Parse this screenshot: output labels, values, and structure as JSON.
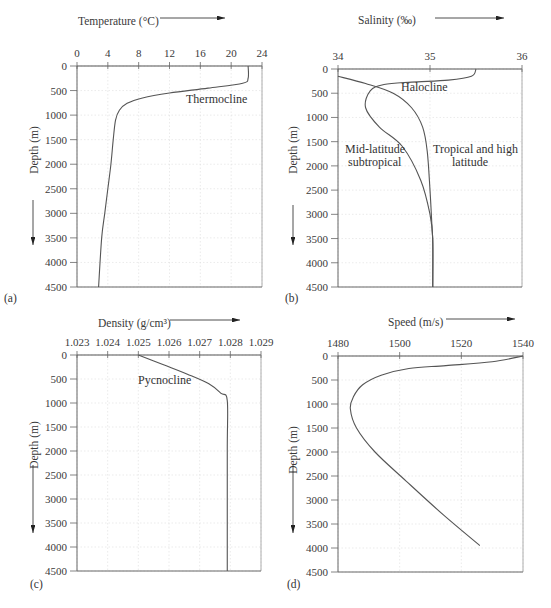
{
  "chart_data": [
    {
      "panel": "(a)",
      "type": "line",
      "title": "",
      "xlabel": "Temperature (°C)",
      "ylabel": "Depth (m)",
      "xlim": [
        0,
        24
      ],
      "ylim": [
        4500,
        0
      ],
      "xticks": [
        "0",
        "4",
        "8",
        "12",
        "16",
        "20",
        "24"
      ],
      "yticks": [
        "0",
        "500",
        "1000",
        "1500",
        "2000",
        "2500",
        "3000",
        "3500",
        "4000",
        "4500"
      ],
      "grid": true,
      "annotations": [
        {
          "text": "Thermocline",
          "x": 17.5,
          "y": 700
        }
      ],
      "series": [
        {
          "name": "Temperature",
          "x": [
            22.2,
            22.2,
            21.5,
            17,
            12,
            8.5,
            6.5,
            5.5,
            5.0,
            4.7,
            4.4,
            4.0,
            3.6,
            3.2,
            2.8
          ],
          "y": [
            0,
            250,
            350,
            450,
            550,
            650,
            760,
            900,
            1100,
            1500,
            2000,
            2500,
            3000,
            3500,
            4500
          ]
        }
      ]
    },
    {
      "panel": "(b)",
      "type": "line",
      "title": "",
      "xlabel": "Salinity (‰)",
      "ylabel": "Depth (m)",
      "xlim": [
        34,
        36
      ],
      "ylim": [
        4500,
        0
      ],
      "xticks": [
        "34",
        "35",
        "36"
      ],
      "yticks": [
        "0",
        "500",
        "1000",
        "1500",
        "2000",
        "2500",
        "3000",
        "3500",
        "4000",
        "4500"
      ],
      "grid": true,
      "annotations": [
        {
          "text": "Halocline",
          "x": 35.0,
          "y": 400
        },
        {
          "text": "Mid-latitude subtropical",
          "x": 34.35,
          "y": 1750
        },
        {
          "text": "Tropical and high latitude",
          "x": 35.45,
          "y": 1750
        }
      ],
      "series": [
        {
          "name": "Tropical and high latitude",
          "x": [
            34.0,
            34.3,
            34.6,
            34.8,
            34.92,
            34.97,
            35.0,
            35.02,
            35.03,
            35.03
          ],
          "y": [
            150,
            300,
            500,
            800,
            1200,
            1700,
            2500,
            3200,
            3600,
            4500
          ]
        },
        {
          "name": "Mid-latitude subtropical",
          "x": [
            35.5,
            35.45,
            35.2,
            34.8,
            34.5,
            34.35,
            34.3,
            34.45,
            34.7,
            34.9,
            35.0,
            35.03,
            35.03
          ],
          "y": [
            0,
            150,
            230,
            270,
            320,
            450,
            800,
            1200,
            1600,
            2300,
            3000,
            3500,
            4500
          ]
        }
      ]
    },
    {
      "panel": "(c)",
      "type": "line",
      "title": "",
      "xlabel": "Density (g/cm³)",
      "ylabel": "Depth (m)",
      "xlim": [
        1.023,
        1.029
      ],
      "ylim": [
        4500,
        0
      ],
      "xticks": [
        "1.023",
        "1.024",
        "1.025",
        "1.026",
        "1.027",
        "1.028",
        "1.029"
      ],
      "yticks": [
        "0",
        "500",
        "1000",
        "1500",
        "2000",
        "2500",
        "3000",
        "3500",
        "4000",
        "4500"
      ],
      "grid": true,
      "annotations": [
        {
          "text": "Pycnocline",
          "x": 1.0265,
          "y": 500
        }
      ],
      "series": [
        {
          "name": "Density",
          "x": [
            1.025,
            1.0258,
            1.0266,
            1.0273,
            1.0277,
            1.0279,
            1.0279,
            1.0279
          ],
          "y": [
            0,
            200,
            400,
            600,
            800,
            950,
            2000,
            4500
          ]
        }
      ]
    },
    {
      "panel": "(d)",
      "type": "line",
      "title": "",
      "xlabel": "Speed (m/s)",
      "ylabel": "Depth (m)",
      "xlim": [
        1480,
        1540
      ],
      "ylim": [
        4500,
        0
      ],
      "xticks": [
        "1480",
        "1500",
        "1520",
        "1540"
      ],
      "yticks": [
        "0",
        "500",
        "1000",
        "1500",
        "2000",
        "2500",
        "3000",
        "3500",
        "4000",
        "4500"
      ],
      "grid": true,
      "annotations": [],
      "series": [
        {
          "name": "Sound speed",
          "x": [
            1540,
            1530,
            1515,
            1503,
            1494,
            1488,
            1485,
            1484,
            1486,
            1492,
            1502,
            1514,
            1526
          ],
          "y": [
            0,
            120,
            200,
            260,
            400,
            600,
            850,
            1100,
            1500,
            2000,
            2600,
            3300,
            3950
          ]
        }
      ]
    }
  ],
  "panels": {
    "a": {
      "label": "(a)",
      "xlabel": "Temperature (°C)",
      "ylabel": "Depth (m)",
      "annotation": "Thermocline"
    },
    "b": {
      "label": "(b)",
      "xlabel": "Salinity (‰)",
      "ylabel": "Depth (m)",
      "annotation1": "Halocline",
      "annotation2a": "Mid-latitude",
      "annotation2b": "subtropical",
      "annotation3a": "Tropical and high",
      "annotation3b": "latitude"
    },
    "c": {
      "label": "(c)",
      "xlabel": "Density (g/cm³)",
      "ylabel": "Depth (m)",
      "annotation": "Pycnocline"
    },
    "d": {
      "label": "(d)",
      "xlabel": "Speed (m/s)",
      "ylabel": "Depth (m)"
    }
  },
  "colors": {
    "line": "#555555",
    "axis": "#666666",
    "grid": "#dddddd",
    "arrow": "#222222"
  }
}
